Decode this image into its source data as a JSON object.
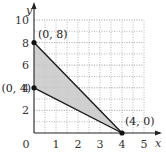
{
  "chart_data": {
    "type": "area",
    "title": "",
    "xlabel": "x",
    "ylabel": "y",
    "xlim": [
      0,
      5
    ],
    "ylim": [
      0,
      10
    ],
    "x_ticks": [
      "0",
      "1",
      "2",
      "3",
      "4",
      "5"
    ],
    "y_ticks": [
      "2",
      "4",
      "6",
      "8",
      "10"
    ],
    "grid": true,
    "grid_step": 0.5,
    "shaded_region": {
      "vertices": [
        [
          0,
          8
        ],
        [
          0,
          4
        ],
        [
          4,
          0
        ]
      ],
      "fill_color": "#c8c8c8",
      "edge_color": "#1a1a1a"
    },
    "points": [
      {
        "x": 0,
        "y": 8,
        "label": "(0, 8)"
      },
      {
        "x": 0,
        "y": 4,
        "label": "(0, 4)"
      },
      {
        "x": 4,
        "y": 0,
        "label": "(4, 0)"
      }
    ]
  }
}
